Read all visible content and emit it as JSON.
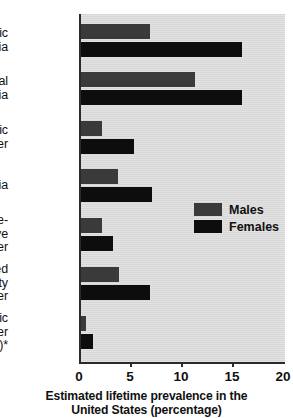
{
  "chart_data": {
    "type": "bar",
    "orientation": "horizontal",
    "title": "",
    "xlabel": "Estimated lifetime prevalence in the United States (percentage)",
    "ylabel": "",
    "xlim": [
      0,
      20
    ],
    "xticks": [
      0,
      5,
      10,
      15,
      20
    ],
    "xtick_labels": [
      "0",
      "5",
      "10",
      "15",
      "20"
    ],
    "grid": false,
    "legend_position": "center-right-inside",
    "categories": [
      "Specific phobia",
      "Social phobia",
      "Panic disorder",
      "Agoraphobia",
      "Obsessive-compulsive disorder",
      "Generalized anxiety disorder",
      "Posttraumatic stress disorder (PTSD)*"
    ],
    "category_label_lines": [
      [
        "Specific",
        "phobia"
      ],
      [
        "Social",
        "phobia"
      ],
      [
        "Panic",
        "disorder"
      ],
      [
        "Agoraphobia"
      ],
      [
        "Obsessive-",
        "compulsive",
        "disorder"
      ],
      [
        "Generalized",
        "anxiety",
        "disorder"
      ],
      [
        "Posttraumatic",
        "stress disorder",
        "(PTSD)*"
      ]
    ],
    "series": [
      {
        "name": "Males",
        "color": "#3a3a3a",
        "values": [
          6.8,
          11.2,
          2.1,
          3.6,
          2.1,
          3.7,
          0.5
        ]
      },
      {
        "name": "Females",
        "color": "#0d0d0d",
        "values": [
          15.8,
          15.8,
          5.2,
          7.0,
          3.1,
          6.8,
          1.2
        ]
      }
    ]
  },
  "legend": {
    "items": [
      {
        "label": "Males",
        "color": "#3a3a3a"
      },
      {
        "label": "Females",
        "color": "#0d0d0d"
      }
    ]
  },
  "axis": {
    "title_line_1": "Estimated lifetime prevalence in the",
    "title_line_2": "United States (percentage)"
  },
  "style": {
    "plot_background": "#d9d9d9",
    "axis_color": "#2a2a2a",
    "text_color": "#111111",
    "page_background": "#ffffff"
  }
}
